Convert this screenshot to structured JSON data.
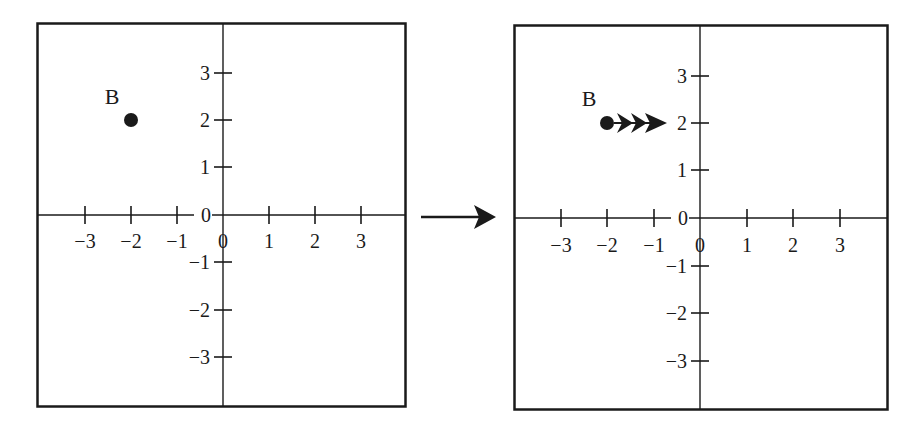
{
  "diagram": {
    "type": "coordinate-plane-translation",
    "colors": {
      "ink": "#1a1a1a",
      "background": "#ffffff"
    },
    "transition_arrow": "right-arrow-icon",
    "panels": [
      {
        "id": "before",
        "x_tick_labels": [
          "−3",
          "−2",
          "−1",
          "0",
          "1",
          "2",
          "3"
        ],
        "y_tick_labels": [
          "3",
          "2",
          "1",
          "0",
          "−1",
          "−2",
          "−3"
        ],
        "point": {
          "label": "B",
          "x": -2,
          "y": 2
        },
        "motion_arrows": 0
      },
      {
        "id": "after",
        "x_tick_labels": [
          "−3",
          "−2",
          "−1",
          "0",
          "1",
          "2",
          "3"
        ],
        "y_tick_labels": [
          "3",
          "2",
          "1",
          "0",
          "−1",
          "−2",
          "−3"
        ],
        "point": {
          "label": "B",
          "x": -2,
          "y": 2
        },
        "motion_arrows": 3,
        "motion_direction": "right"
      }
    ]
  },
  "labels": {
    "left": {
      "point": "B",
      "x": [
        "−3",
        "−2",
        "−1",
        "0",
        "1",
        "2",
        "3"
      ],
      "y": {
        "p3": "3",
        "p2": "2",
        "p1": "1",
        "z": "0",
        "n1": "−1",
        "n2": "−2",
        "n3": "−3"
      }
    },
    "right": {
      "point": "B",
      "x": [
        "−3",
        "−2",
        "−1",
        "0",
        "1",
        "2",
        "3"
      ],
      "y": {
        "p3": "3",
        "p2": "2",
        "p1": "1",
        "z": "0",
        "n1": "−1",
        "n2": "−2",
        "n3": "−3"
      }
    }
  }
}
